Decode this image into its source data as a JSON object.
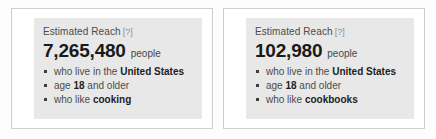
{
  "widget": {
    "name": "estimated-reach-comparison",
    "help_label": "[?]",
    "accent_color": "#e8e8e8",
    "border_color": "#cfcfcf",
    "text_color": "#4b4b4b"
  },
  "panels": [
    {
      "header": "Estimated Reach",
      "help": "[?]",
      "count": "7,265,480",
      "unit": "people",
      "criteria": [
        {
          "prefix": "who live in the ",
          "strong": "United States",
          "suffix": ""
        },
        {
          "prefix": "age ",
          "strong": "18",
          "suffix": " and older"
        },
        {
          "prefix": "who like ",
          "strong": "cooking",
          "suffix": ""
        }
      ]
    },
    {
      "header": "Estimated Reach",
      "help": "[?]",
      "count": "102,980",
      "unit": "people",
      "criteria": [
        {
          "prefix": "who live in the ",
          "strong": "United States",
          "suffix": ""
        },
        {
          "prefix": "age ",
          "strong": "18",
          "suffix": " and older"
        },
        {
          "prefix": "who like ",
          "strong": "cookbooks",
          "suffix": ""
        }
      ]
    }
  ]
}
